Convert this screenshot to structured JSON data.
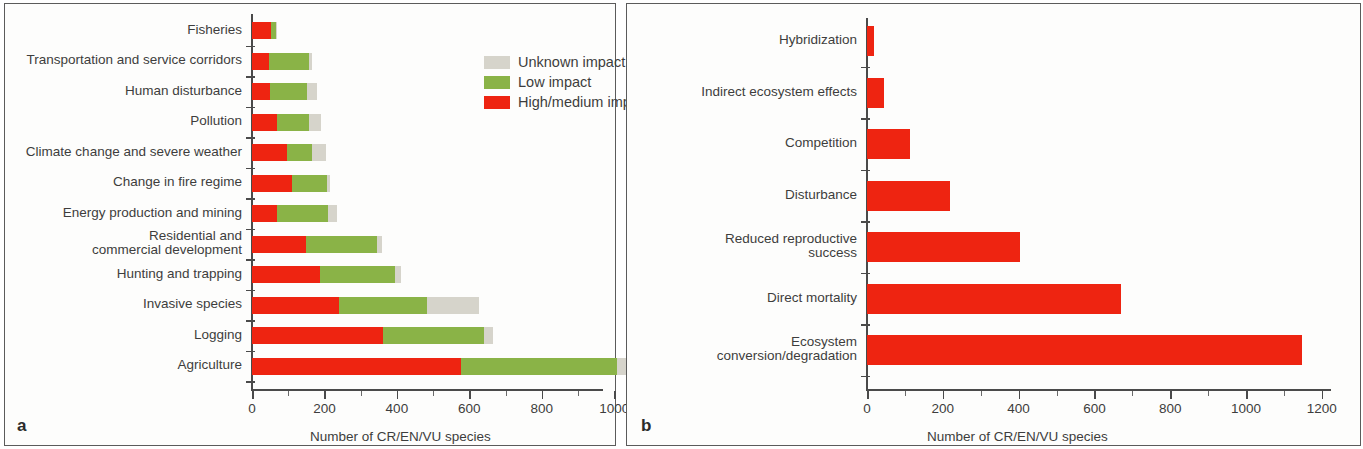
{
  "figure": {
    "panel_a_letter": "a",
    "panel_b_letter": "b"
  },
  "colors": {
    "high_medium_impact": "#ee2411",
    "low_impact": "#8ab347",
    "unknown_impact": "#d6d4cb",
    "axis": "#4a4a4a",
    "text": "#3d3d3d",
    "panel_border": "#5b5b5b"
  },
  "legend": {
    "items": [
      {
        "label": "Unknown impact",
        "color": "#d6d4cb"
      },
      {
        "label": "Low impact",
        "color": "#8ab347"
      },
      {
        "label": "High/medium impact",
        "color": "#ee2411"
      }
    ]
  },
  "chart_data": [
    {
      "panel": "a",
      "type": "bar",
      "orientation": "horizontal",
      "stacked": true,
      "title": "",
      "xlabel": "Number of CR/EN/VU species",
      "ylabel": "",
      "xlim": [
        0,
        1100
      ],
      "xticks": [
        0,
        200,
        400,
        600,
        800,
        1000
      ],
      "xticklabels": [
        "0",
        "200",
        "400",
        "600",
        "800",
        "1000"
      ],
      "grid": false,
      "legend_position": "upper right",
      "categories": [
        "Fisheries",
        "Transportation and service corridors",
        "Human disturbance",
        "Pollution",
        "Climate change and severe weather",
        "Change in fire regime",
        "Energy production and mining",
        "Residential and\ncommercial development",
        "Hunting and trapping",
        "Invasive species",
        "Logging",
        "Agriculture"
      ],
      "series": [
        {
          "name": "High/medium impact",
          "color": "#ee2411",
          "values": [
            53,
            47,
            50,
            69,
            97,
            111,
            69,
            148,
            188,
            240,
            362,
            577
          ]
        },
        {
          "name": "Low impact",
          "color": "#8ab347",
          "values": [
            12,
            110,
            102,
            88,
            69,
            97,
            141,
            197,
            207,
            244,
            279,
            431
          ]
        },
        {
          "name": "Unknown impact",
          "color": "#d6d4cb",
          "values": [
            4,
            9,
            28,
            33,
            39,
            7,
            24,
            14,
            16,
            143,
            25,
            53
          ]
        }
      ],
      "totals": [
        69,
        166,
        180,
        190,
        205,
        215,
        234,
        359,
        411,
        627,
        666,
        1061
      ]
    },
    {
      "panel": "b",
      "type": "bar",
      "orientation": "horizontal",
      "stacked": false,
      "title": "",
      "xlabel": "Number of CR/EN/VU species",
      "ylabel": "",
      "xlim": [
        0,
        1260
      ],
      "xticks": [
        0,
        200,
        400,
        600,
        800,
        1000,
        1200
      ],
      "xticklabels": [
        "0",
        "200",
        "400",
        "600",
        "800",
        "1000",
        "1200"
      ],
      "grid": false,
      "categories": [
        "Hybridization",
        "Indirect ecosystem effects",
        "Competition",
        "Disturbance",
        "Reduced reproductive\nsuccess",
        "Direct mortality",
        "Ecosystem\nconversion/degradation"
      ],
      "series": [
        {
          "name": "Number of CR/EN/VU species",
          "color": "#ee2411",
          "values": [
            18,
            45,
            113,
            219,
            405,
            670,
            1148
          ]
        }
      ]
    }
  ]
}
